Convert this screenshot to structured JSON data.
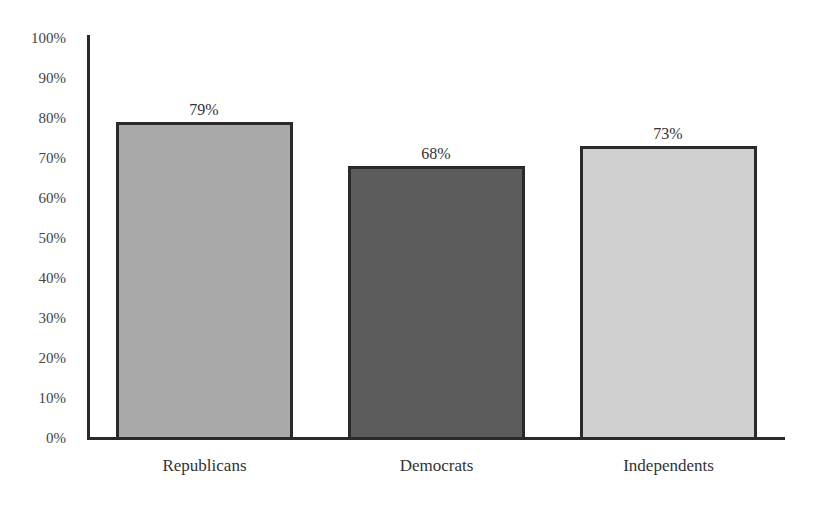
{
  "chart_data": {
    "type": "bar",
    "title": "",
    "xlabel": "",
    "ylabel": "",
    "categories": [
      "Republicans",
      "Democrats",
      "Independents"
    ],
    "values": [
      79,
      68,
      73
    ],
    "value_labels": [
      "79%",
      "68%",
      "73%"
    ],
    "colors": [
      "#a9a9a9",
      "#5c5c5c",
      "#d0d0d0"
    ],
    "ylim": [
      0,
      100
    ],
    "yticks": [
      "0%",
      "10%",
      "20%",
      "30%",
      "40%",
      "50%",
      "60%",
      "70%",
      "80%",
      "90%",
      "100%"
    ],
    "grid": false,
    "legend": null
  }
}
